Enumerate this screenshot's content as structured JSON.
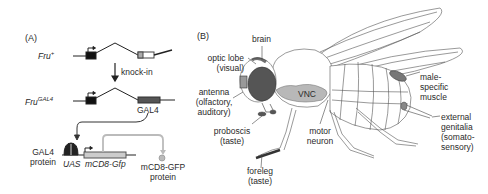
{
  "panel_a": {
    "label": "(A)",
    "fru_plus": {
      "gene": "Fru",
      "sup": "+"
    },
    "arrow_label": "knock-in",
    "fru_gal4": {
      "gene": "Fru",
      "sup": "GAL4"
    },
    "gal4_exon": "GAL4",
    "gal4_protein": [
      "GAL4",
      "protein"
    ],
    "uas": "UAS",
    "reporter": "mCD8-Gfp",
    "reporter_protein": [
      "mCD8-GFP",
      "protein"
    ]
  },
  "panel_b": {
    "label": "(B)",
    "labels": {
      "brain": "brain",
      "optic_lobe": [
        "optic lobe",
        "(visual)"
      ],
      "antenna": [
        "antenna",
        "(olfactory,",
        "auditory)"
      ],
      "proboscis": [
        "proboscis",
        "(taste)"
      ],
      "foreleg": [
        "foreleg",
        "(taste)"
      ],
      "vnc": "VNC",
      "motor_neuron": [
        "motor",
        "neuron"
      ],
      "male_muscle": [
        "male-",
        "specific",
        "muscle"
      ],
      "genitalia": [
        "external",
        "genitalia",
        "(somato-",
        "sensory)"
      ]
    }
  },
  "colors": {
    "exon_dark": "#111111",
    "gal4_exon": "#555555",
    "gfp": "#c8c8c8",
    "vnc": "#b8b8b8",
    "eye": "#555555",
    "line": "#333333"
  }
}
